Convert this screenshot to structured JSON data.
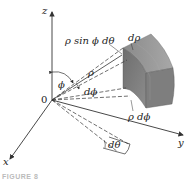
{
  "figure": {
    "type": "spherical-coordinates-volume-element",
    "caption": "FIGURE 8",
    "axes": {
      "x": "x",
      "y": "y",
      "z": "z",
      "origin": "0"
    },
    "labels": {
      "arc_theta": "ρ sin ϕ dθ",
      "d_rho": "dρ",
      "rho": "ρ",
      "phi": "ϕ",
      "d_phi": "dϕ",
      "arc_phi": "ρ dϕ",
      "d_theta": "dθ"
    },
    "colors": {
      "solid_front": "#7a7a7a",
      "solid_top": "#9a9a9a",
      "solid_side": "#8a8a8a",
      "axis": "#333333",
      "dashed": "#333333"
    }
  }
}
